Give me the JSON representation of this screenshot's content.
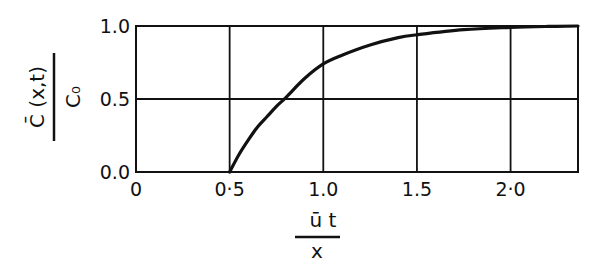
{
  "chart_data": {
    "type": "line",
    "title": "",
    "xlabel": "ū t / x",
    "ylabel": "C̄ (x,t) / C₀",
    "xlabel_parts": {
      "numerator": "ū   t",
      "denominator": "x"
    },
    "ylabel_parts": {
      "numerator": "C̄ (x,t)",
      "denominator": "C₀"
    },
    "xlim": [
      0,
      2.36
    ],
    "ylim": [
      0,
      1.0
    ],
    "x_ticks": [
      "0",
      "0·5",
      "1.0",
      "1.5",
      "2·0"
    ],
    "x_tick_values": [
      0,
      0.5,
      1.0,
      1.5,
      2.0
    ],
    "y_ticks": [
      "0.0",
      "0.5",
      "1.0"
    ],
    "y_tick_values": [
      0,
      0.5,
      1.0
    ],
    "grid": true,
    "legend": null,
    "series": [
      {
        "name": "C̄/C₀",
        "x": [
          0.5,
          0.55,
          0.6,
          0.65,
          0.7,
          0.75,
          0.8,
          0.9,
          1.0,
          1.1,
          1.25,
          1.4,
          1.5,
          1.75,
          2.0,
          2.2,
          2.36
        ],
        "y": [
          0.0,
          0.12,
          0.22,
          0.31,
          0.38,
          0.45,
          0.51,
          0.64,
          0.74,
          0.8,
          0.87,
          0.92,
          0.94,
          0.975,
          0.99,
          0.997,
          1.0
        ]
      }
    ]
  }
}
